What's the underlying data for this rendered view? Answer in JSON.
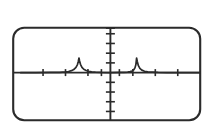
{
  "device": {
    "name": "graphing-calculator-screen",
    "screen_bezel_color": "#2b2b2b",
    "screen_background_color": "#ffffff",
    "corner_radius_px": 11,
    "bezel_stroke_width_px": 2.1
  },
  "chart_data": {
    "type": "line",
    "title": "",
    "subtitle": "",
    "xlabel": "",
    "ylabel": "",
    "grid": false,
    "legend": null,
    "legend_position": "none",
    "axis_color": "#2b2b2b",
    "curve_color": "#2b2b2b",
    "xlim": [
      -6,
      6
    ],
    "ylim": [
      -3.2,
      3.2
    ],
    "x_axis": {
      "visible": true,
      "y_value": 0,
      "tick_count": 8,
      "tick_values": [
        -4.5,
        -3,
        -1.5,
        -0.6,
        0.6,
        1.5,
        3,
        4.5
      ],
      "tick_labels": [],
      "tick_length_px": 7
    },
    "y_axis": {
      "visible": true,
      "x_value": 0,
      "tick_count": 9,
      "tick_values": [
        -2.8,
        -2.1,
        -1.4,
        -0.7,
        0.7,
        1.4,
        2.1,
        2.8,
        3.2
      ],
      "tick_labels": [],
      "tick_length_px": 9
    },
    "series": [
      {
        "name": "f(x)",
        "shape": "two-spikes",
        "baseline_y": 0,
        "peaks": [
          {
            "x": -2.1,
            "y": 1.05,
            "half_width": 0.42
          },
          {
            "x": 1.75,
            "y": 1.05,
            "half_width": 0.42
          }
        ],
        "x": [
          -6.0,
          -5.0,
          -4.0,
          -3.4,
          -3.0,
          -2.8,
          -2.6,
          -2.45,
          -2.3,
          -2.2,
          -2.14,
          -2.1,
          -2.06,
          -2.0,
          -1.9,
          -1.78,
          -1.62,
          -1.45,
          -1.25,
          -1.0,
          -0.6,
          0.0,
          0.6,
          0.9,
          1.15,
          1.32,
          1.45,
          1.56,
          1.64,
          1.7,
          1.75,
          1.8,
          1.87,
          1.97,
          2.1,
          2.28,
          2.5,
          2.8,
          3.2,
          3.8,
          4.6,
          5.4,
          6.0
        ],
        "y": [
          0.0,
          0.0,
          0.01,
          0.02,
          0.05,
          0.08,
          0.14,
          0.22,
          0.38,
          0.58,
          0.82,
          1.05,
          0.84,
          0.6,
          0.38,
          0.24,
          0.15,
          0.09,
          0.05,
          0.03,
          0.01,
          0.0,
          0.01,
          0.02,
          0.04,
          0.07,
          0.12,
          0.2,
          0.34,
          0.56,
          1.05,
          0.78,
          0.5,
          0.3,
          0.18,
          0.1,
          0.05,
          0.03,
          0.01,
          0.0,
          0.0,
          0.0,
          0.0
        ]
      }
    ]
  }
}
